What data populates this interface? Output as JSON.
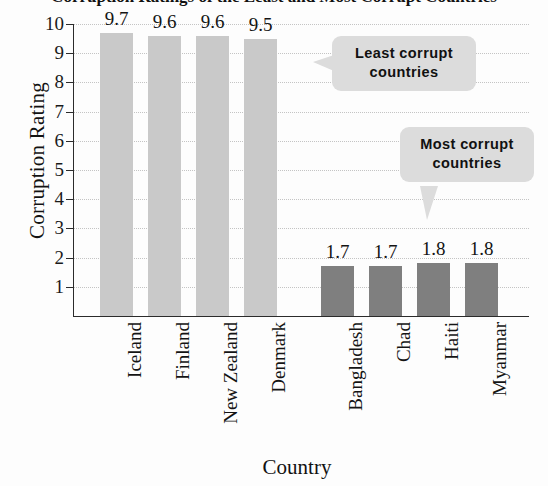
{
  "chart_data": {
    "type": "bar",
    "title": "Corruption Ratings of the Least and Most Corrupt Countries",
    "xlabel": "Country",
    "ylabel": "Corruption Rating",
    "ylim": [
      0,
      10
    ],
    "ytick_labels": [
      "10",
      "9",
      "8",
      "7",
      "6",
      "5",
      "4",
      "3",
      "2",
      "1"
    ],
    "ytick_values": [
      10,
      9,
      8,
      7,
      6,
      5,
      4,
      3,
      2,
      1
    ],
    "grid": true,
    "legend": "none",
    "categories": [
      "Iceland",
      "Finland",
      "New Zealand",
      "Denmark",
      "Bangladesh",
      "Chad",
      "Haiti",
      "Myanmar"
    ],
    "values": [
      9.7,
      9.6,
      9.6,
      9.5,
      1.7,
      1.7,
      1.8,
      1.8
    ],
    "value_labels": [
      "9.7",
      "9.6",
      "9.6",
      "9.5",
      "1.7",
      "1.7",
      "1.8",
      "1.8"
    ],
    "bar_colors": [
      "#c9c9c9",
      "#c9c9c9",
      "#c9c9c9",
      "#c9c9c9",
      "#7f7f7f",
      "#7f7f7f",
      "#7f7f7f",
      "#7f7f7f"
    ],
    "group_gap_after_index": 3,
    "annotations": [
      {
        "line1": "Least corrupt",
        "line2": "countries",
        "points_to": "light-gray bars"
      },
      {
        "line1": "Most corrupt",
        "line2": "countries",
        "points_to": "dark-gray bars"
      }
    ]
  },
  "colors": {
    "light_bar": "#c9c9c9",
    "dark_bar": "#7f7f7f",
    "callout_background": "#dcdcdc",
    "axis": "#2b2b2b",
    "gridline": "#c4c4c4",
    "background": "#fdfdfd"
  }
}
